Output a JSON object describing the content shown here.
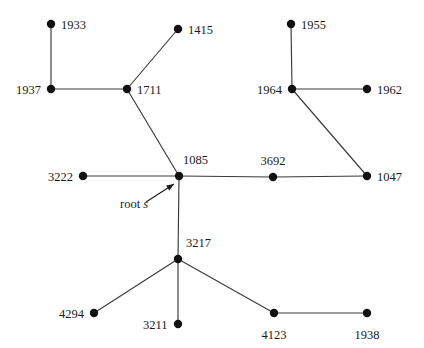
{
  "diagram": {
    "colors": {
      "background": "#ffffff",
      "node": "#111111",
      "edge": "#3a3a3a",
      "text": "#1a1a1a"
    },
    "annotation": {
      "text_prefix": "root ",
      "variable": "s",
      "points_to": "1085"
    },
    "nodes": [
      {
        "id": "1933",
        "label": "1933",
        "x": 51,
        "y": 24,
        "label_dx": 10,
        "label_dy": -5,
        "anchor": "start"
      },
      {
        "id": "1415",
        "label": "1415",
        "x": 178,
        "y": 29,
        "label_dx": 10,
        "label_dy": -5,
        "anchor": "start"
      },
      {
        "id": "1955",
        "label": "1955",
        "x": 291,
        "y": 24,
        "label_dx": 10,
        "label_dy": -5,
        "anchor": "start"
      },
      {
        "id": "1937",
        "label": "1937",
        "x": 51,
        "y": 89,
        "label_dx": -10,
        "label_dy": -5,
        "anchor": "end"
      },
      {
        "id": "1711",
        "label": "1711",
        "x": 127,
        "y": 89,
        "label_dx": 10,
        "label_dy": -5,
        "anchor": "start"
      },
      {
        "id": "1964",
        "label": "1964",
        "x": 292,
        "y": 89,
        "label_dx": -10,
        "label_dy": -5,
        "anchor": "end"
      },
      {
        "id": "1962",
        "label": "1962",
        "x": 367,
        "y": 89,
        "label_dx": 10,
        "label_dy": -5,
        "anchor": "start"
      },
      {
        "id": "3222",
        "label": "3222",
        "x": 83,
        "y": 176,
        "label_dx": -10,
        "label_dy": -5,
        "anchor": "end"
      },
      {
        "id": "1085",
        "label": "1085",
        "x": 179,
        "y": 176,
        "label_dx": 4,
        "label_dy": -22,
        "anchor": "start"
      },
      {
        "id": "3692",
        "label": "3692",
        "x": 273,
        "y": 177,
        "label_dx": 0,
        "label_dy": -22,
        "anchor": "middle"
      },
      {
        "id": "1047",
        "label": "1047",
        "x": 367,
        "y": 176,
        "label_dx": 10,
        "label_dy": -5,
        "anchor": "start"
      },
      {
        "id": "3217",
        "label": "3217",
        "x": 178,
        "y": 259,
        "label_dx": 8,
        "label_dy": -22,
        "anchor": "start"
      },
      {
        "id": "4294",
        "label": "4294",
        "x": 94,
        "y": 313,
        "label_dx": -10,
        "label_dy": -5,
        "anchor": "end"
      },
      {
        "id": "3211",
        "label": "3211",
        "x": 178,
        "y": 324,
        "label_dx": -10,
        "label_dy": -5,
        "anchor": "end"
      },
      {
        "id": "4123",
        "label": "4123",
        "x": 274,
        "y": 313,
        "label_dx": 0,
        "label_dy": 16,
        "anchor": "middle"
      },
      {
        "id": "1938",
        "label": "1938",
        "x": 367,
        "y": 313,
        "label_dx": 0,
        "label_dy": 16,
        "anchor": "middle"
      }
    ],
    "edges": [
      {
        "from": "1933",
        "to": "1937"
      },
      {
        "from": "1937",
        "to": "1711"
      },
      {
        "from": "1711",
        "to": "1415"
      },
      {
        "from": "1711",
        "to": "1085"
      },
      {
        "from": "3222",
        "to": "1085"
      },
      {
        "from": "1085",
        "to": "3692"
      },
      {
        "from": "3692",
        "to": "1047"
      },
      {
        "from": "1047",
        "to": "1964"
      },
      {
        "from": "1964",
        "to": "1955"
      },
      {
        "from": "1964",
        "to": "1962"
      },
      {
        "from": "1085",
        "to": "3217"
      },
      {
        "from": "3217",
        "to": "4294"
      },
      {
        "from": "3217",
        "to": "3211"
      },
      {
        "from": "3217",
        "to": "4123"
      },
      {
        "from": "4123",
        "to": "1938"
      }
    ],
    "arrow": {
      "tail_x": 146,
      "tail_y": 202,
      "head_x": 174,
      "head_y": 184
    }
  }
}
